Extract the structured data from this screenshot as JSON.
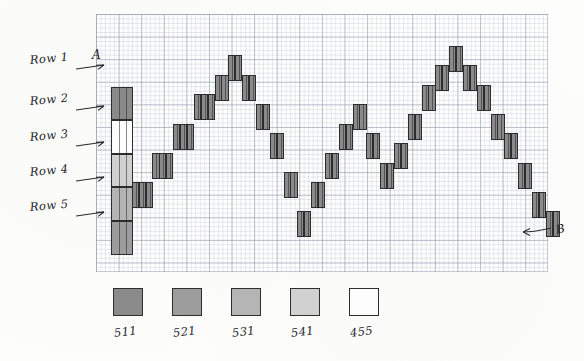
{
  "chart_data": {
    "type": "bar",
    "title": "",
    "xlabel": "",
    "ylabel": "",
    "grid": true,
    "legend_position": "bottom",
    "annotations": [
      {
        "name": "point-a",
        "text": "A",
        "target": "first column (leftmost stacked bar)"
      },
      {
        "name": "point-b",
        "text": "B",
        "target": "last bar (rightmost, bottom right)"
      }
    ],
    "row_bands": [
      {
        "label": "Row 1",
        "swatch": "511"
      },
      {
        "label": "Row 2",
        "swatch": "455"
      },
      {
        "label": "Row 3",
        "swatch": "541"
      },
      {
        "label": "Row 4",
        "swatch": "531"
      },
      {
        "label": "Row 5",
        "swatch": "521"
      }
    ],
    "legend": {
      "entries": [
        {
          "label": "511",
          "color": "#8b8b8b"
        },
        {
          "label": "521",
          "color": "#9d9d9d"
        },
        {
          "label": "531",
          "color": "#b5b5b5"
        },
        {
          "label": "541",
          "color": "#d2d2d2"
        },
        {
          "label": "455",
          "color": "#ffffff"
        }
      ]
    },
    "series": [
      {
        "name": "wave",
        "color": "#8b8b8b",
        "note": "each bar is one narrow column; value = vertical offset of bar top in grid rows from chart top",
        "values": [
          10.0,
          10.0,
          10.0,
          8.0,
          8.0,
          8.0,
          6.5,
          6.5,
          6.5,
          5.0,
          5.0,
          5.0,
          3.5,
          3.5,
          3.5,
          2.5,
          2.5,
          1.5,
          1.5,
          2.5,
          2.5,
          4.0,
          4.0,
          5.5,
          5.5,
          7.5,
          7.5,
          9.5,
          9.5,
          8.0,
          8.0,
          6.5,
          6.5,
          5.0,
          5.0,
          4.0,
          4.0,
          5.5,
          5.5,
          7.0,
          7.0,
          6.0,
          6.0,
          4.5,
          4.5,
          3.0,
          3.0,
          2.0,
          2.0,
          1.0,
          1.0,
          2.0,
          2.0,
          3.0,
          3.0,
          4.5,
          4.5,
          5.5,
          5.5,
          7.0,
          7.0,
          8.5,
          8.5,
          9.5,
          9.5
        ]
      }
    ]
  },
  "chart": {
    "column_a": {
      "label": "A",
      "segments": [
        {
          "row": "Row 1",
          "color": "#8b8b8b"
        },
        {
          "row": "Row 2",
          "color": "#ffffff"
        },
        {
          "row": "Row 3",
          "color": "#d2d2d2"
        },
        {
          "row": "Row 4",
          "color": "#b5b5b5"
        },
        {
          "row": "Row 5",
          "color": "#9d9d9d"
        }
      ]
    },
    "point_b_label": "B"
  }
}
